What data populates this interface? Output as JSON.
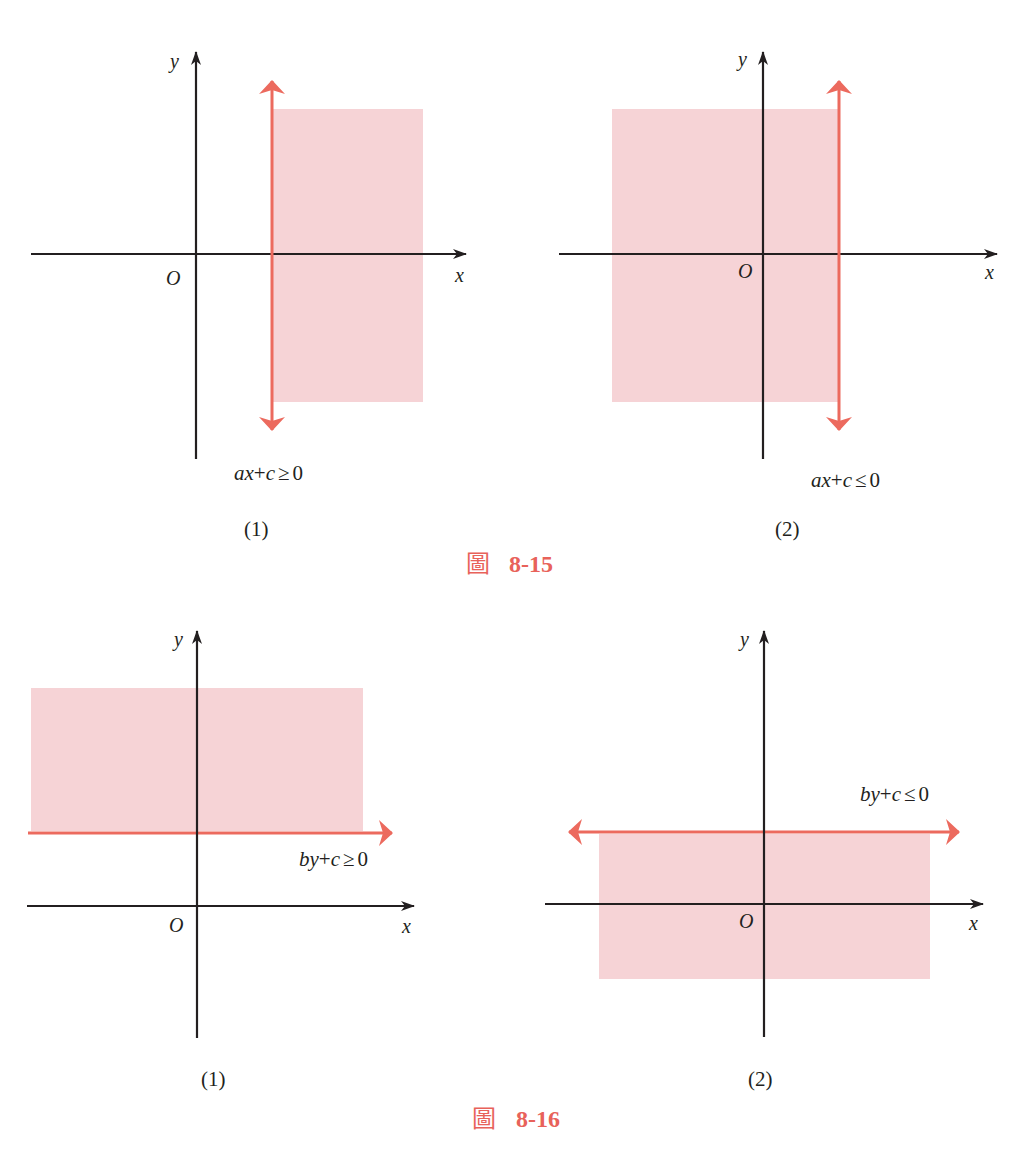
{
  "colors": {
    "axis": "#231f20",
    "boundary": "#ec6a5e",
    "region": "#f6d3d6",
    "caption": "#e8625a"
  },
  "figure_8_15": {
    "caption_char": "圖",
    "caption_number": "8-15",
    "panels": [
      {
        "label": "(1)",
        "x_axis_label": "x",
        "y_axis_label": "y",
        "origin_label": "O",
        "inequality": "ax+c ≥ 0",
        "inequality_parts": {
          "a": "ax",
          "op": "+",
          "c": "c",
          "rel": "≥",
          "rhs": "0"
        },
        "boundary": "vertical line x = -c/a (right of y-axis)",
        "shaded_side": "right"
      },
      {
        "label": "(2)",
        "x_axis_label": "x",
        "y_axis_label": "y",
        "origin_label": "O",
        "inequality": "ax+c ≤ 0",
        "inequality_parts": {
          "a": "ax",
          "op": "+",
          "c": "c",
          "rel": "≤",
          "rhs": "0"
        },
        "boundary": "vertical line x = -c/a (right of y-axis)",
        "shaded_side": "left"
      }
    ]
  },
  "figure_8_16": {
    "caption_char": "圖",
    "caption_number": "8-16",
    "panels": [
      {
        "label": "(1)",
        "x_axis_label": "x",
        "y_axis_label": "y",
        "origin_label": "O",
        "inequality": "by+c ≥ 0",
        "inequality_parts": {
          "a": "by",
          "op": "+",
          "c": "c",
          "rel": "≥",
          "rhs": "0"
        },
        "boundary": "horizontal line y = -c/b (above x-axis)",
        "shaded_side": "above"
      },
      {
        "label": "(2)",
        "x_axis_label": "x",
        "y_axis_label": "y",
        "origin_label": "O",
        "inequality": "by+c ≤ 0",
        "inequality_parts": {
          "a": "by",
          "op": "+",
          "c": "c",
          "rel": "≤",
          "rhs": "0"
        },
        "boundary": "horizontal line y = -c/b (above x-axis)",
        "shaded_side": "below"
      }
    ]
  }
}
